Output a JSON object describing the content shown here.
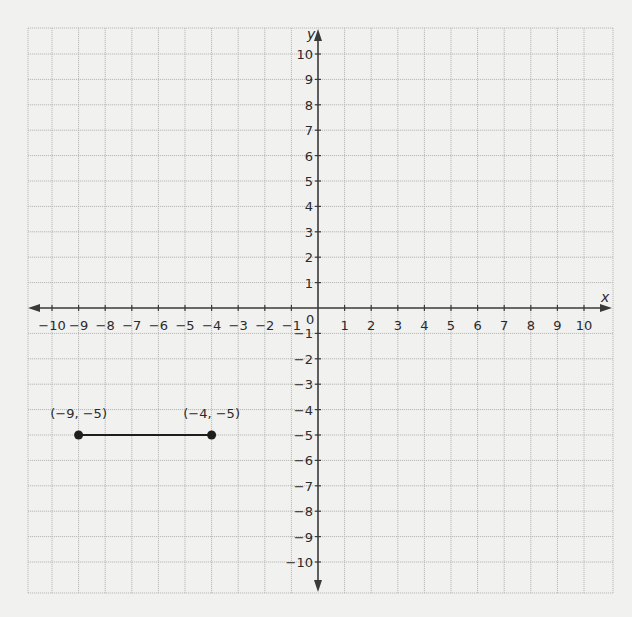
{
  "chart_data": {
    "type": "scatter",
    "title": "",
    "xlabel": "x",
    "ylabel": "y",
    "xlim": [
      -10,
      10
    ],
    "ylim": [
      -10,
      10
    ],
    "grid": true,
    "x_ticks": [
      -10,
      -9,
      -8,
      -7,
      -6,
      -5,
      -4,
      -3,
      -2,
      -1,
      1,
      2,
      3,
      4,
      5,
      6,
      7,
      8,
      9,
      10
    ],
    "y_ticks": [
      -10,
      -9,
      -8,
      -7,
      -6,
      -5,
      -4,
      -3,
      -2,
      -1,
      1,
      2,
      3,
      4,
      5,
      6,
      7,
      8,
      9,
      10
    ],
    "origin_label": "0",
    "points": [
      {
        "x": -9,
        "y": -5,
        "label": "(−9, −5)"
      },
      {
        "x": -4,
        "y": -5,
        "label": "(−4, −5)"
      }
    ],
    "segments": [
      {
        "from": [
          -9,
          -5
        ],
        "to": [
          -4,
          -5
        ]
      }
    ]
  }
}
